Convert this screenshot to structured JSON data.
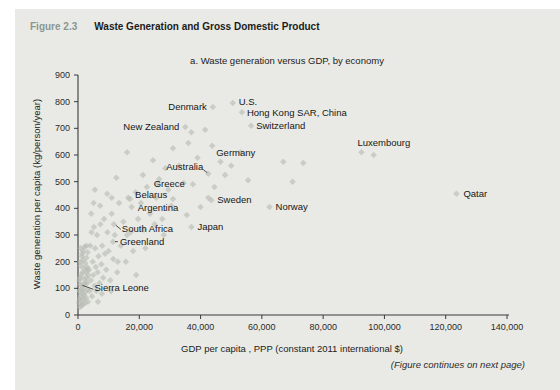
{
  "figure": {
    "label": "Figure 2.3",
    "title": "Waste Generation and Gross Domestic Product",
    "subtitle": "a. Waste generation versus GDP, by economy",
    "footer_note": "(Figure continues on next page)"
  },
  "colors": {
    "paper": "#e9eae5",
    "marker": "#b7bcb3",
    "axis": "#3a3a3a",
    "figure_label_text": "#8a9693",
    "body_text": "#1b1b1b"
  },
  "chart_data": {
    "type": "scatter",
    "title": "a. Waste generation versus GDP, by economy",
    "xlabel": "GDP per capita , PPP (constant 2011 international $)",
    "ylabel": "Waste generation per capita (kg/person/year)",
    "xlim": [
      0,
      140000
    ],
    "ylim": [
      0,
      900
    ],
    "grid": false,
    "x_ticks": [
      0,
      20000,
      40000,
      60000,
      80000,
      100000,
      120000,
      140000
    ],
    "x_tick_labels": [
      "0",
      "20,000",
      "40,000",
      "60,000",
      "80,000",
      "100,000",
      "120,000",
      "140,000"
    ],
    "y_ticks": [
      0,
      100,
      200,
      300,
      400,
      500,
      600,
      700,
      800,
      900
    ],
    "y_tick_labels": [
      "0",
      "100",
      "200",
      "300",
      "400",
      "500",
      "600",
      "700",
      "800",
      "900"
    ],
    "labeled_points": [
      {
        "name": "Denmark",
        "gdp": 44000,
        "waste": 780,
        "anchor": "end",
        "dx": -6,
        "dy": 3
      },
      {
        "name": "U.S.",
        "gdp": 50500,
        "waste": 795,
        "anchor": "start",
        "dx": 6,
        "dy": 2
      },
      {
        "name": "Hong Kong SAR, China",
        "gdp": 53500,
        "waste": 760,
        "anchor": "start",
        "dx": 5,
        "dy": 4
      },
      {
        "name": "Switzerland",
        "gdp": 56500,
        "waste": 710,
        "anchor": "start",
        "dx": 5,
        "dy": 3
      },
      {
        "name": "New Zealand",
        "gdp": 35000,
        "waste": 705,
        "anchor": "end",
        "dx": -6,
        "dy": 3
      },
      {
        "name": "Germany",
        "gdp": 43800,
        "waste": 635,
        "anchor": "start",
        "dx": 4,
        "dy": 10
      },
      {
        "name": "Australia",
        "gdp": 42500,
        "waste": 530,
        "anchor": "end",
        "dx": -5,
        "dy": -4,
        "leader": [
          -5,
          -4,
          -1,
          -1
        ]
      },
      {
        "name": "Greece",
        "gdp": 26000,
        "waste": 490,
        "anchor": "start",
        "dx": -4,
        "dy": 3
      },
      {
        "name": "Belarus",
        "gdp": 17000,
        "waste": 435,
        "anchor": "start",
        "dx": 5,
        "dy": -1
      },
      {
        "name": "Argentina",
        "gdp": 17500,
        "waste": 405,
        "anchor": "start",
        "dx": 6,
        "dy": 4
      },
      {
        "name": "Sweden",
        "gdp": 43500,
        "waste": 430,
        "anchor": "start",
        "dx": 6,
        "dy": 3
      },
      {
        "name": "Norway",
        "gdp": 62500,
        "waste": 405,
        "anchor": "start",
        "dx": 6,
        "dy": 3
      },
      {
        "name": "Japan",
        "gdp": 37000,
        "waste": 330,
        "anchor": "start",
        "dx": 6,
        "dy": 3
      },
      {
        "name": "South Africa",
        "gdp": 11700,
        "waste": 340,
        "anchor": "start",
        "dx": 8,
        "dy": 8,
        "leader": [
          7,
          5,
          2,
          1
        ]
      },
      {
        "name": "Greenland",
        "gdp": 11400,
        "waste": 275,
        "anchor": "start",
        "dx": 7,
        "dy": 3,
        "leader": [
          5,
          0,
          2,
          0
        ]
      },
      {
        "name": "Sierra Leone",
        "gdp": 800,
        "waste": 115,
        "anchor": "start",
        "dx": 14,
        "dy": 7,
        "leader": [
          13,
          5,
          2,
          1
        ]
      },
      {
        "name": "Luxembourg",
        "gdp": 92500,
        "waste": 610,
        "anchor": "start",
        "dx": -4,
        "dy": -6
      },
      {
        "name": "Qatar",
        "gdp": 123500,
        "waste": 455,
        "anchor": "start",
        "dx": 7,
        "dy": 3
      }
    ],
    "points": [
      [
        350,
        45
      ],
      [
        500,
        90
      ],
      [
        650,
        30
      ],
      [
        700,
        140
      ],
      [
        850,
        70
      ],
      [
        950,
        185
      ],
      [
        1050,
        55
      ],
      [
        1150,
        110
      ],
      [
        1250,
        220
      ],
      [
        1350,
        80
      ],
      [
        1450,
        160
      ],
      [
        1550,
        40
      ],
      [
        1650,
        240
      ],
      [
        1750,
        100
      ],
      [
        1850,
        175
      ],
      [
        1950,
        60
      ],
      [
        2050,
        135
      ],
      [
        2150,
        255
      ],
      [
        2250,
        85
      ],
      [
        2350,
        195
      ],
      [
        2450,
        120
      ],
      [
        2550,
        160
      ],
      [
        2650,
        65
      ],
      [
        2750,
        215
      ],
      [
        2850,
        140
      ],
      [
        2950,
        180
      ],
      [
        3050,
        95
      ],
      [
        3150,
        235
      ],
      [
        3250,
        50
      ],
      [
        3350,
        150
      ],
      [
        900,
        250
      ],
      [
        1200,
        35
      ],
      [
        1600,
        205
      ],
      [
        2000,
        75
      ],
      [
        3000,
        120
      ],
      [
        450,
        130
      ],
      [
        750,
        200
      ],
      [
        1100,
        150
      ],
      [
        1400,
        230
      ],
      [
        1900,
        115
      ],
      [
        2300,
        45
      ],
      [
        2700,
        260
      ],
      [
        3100,
        170
      ],
      [
        600,
        60
      ],
      [
        1000,
        95
      ],
      [
        3600,
        170
      ],
      [
        3800,
        90
      ],
      [
        4000,
        260
      ],
      [
        4200,
        130
      ],
      [
        4400,
        310
      ],
      [
        4600,
        70
      ],
      [
        4800,
        200
      ],
      [
        5000,
        150
      ],
      [
        5200,
        330
      ],
      [
        5400,
        110
      ],
      [
        5600,
        250
      ],
      [
        5800,
        180
      ],
      [
        6000,
        90
      ],
      [
        6200,
        300
      ],
      [
        6400,
        160
      ],
      [
        6700,
        220
      ],
      [
        7000,
        120
      ],
      [
        7300,
        340
      ],
      [
        7600,
        190
      ],
      [
        7900,
        260
      ],
      [
        8200,
        140
      ],
      [
        8500,
        360
      ],
      [
        8800,
        230
      ],
      [
        6500,
        50
      ],
      [
        7800,
        80
      ],
      [
        5500,
        470
      ],
      [
        7200,
        410
      ],
      [
        4300,
        380
      ],
      [
        5100,
        420
      ],
      [
        9200,
        170
      ],
      [
        9600,
        310
      ],
      [
        10000,
        240
      ],
      [
        10500,
        130
      ],
      [
        11000,
        380
      ],
      [
        11500,
        210
      ],
      [
        12000,
        300
      ],
      [
        12800,
        160
      ],
      [
        13400,
        420
      ],
      [
        14000,
        260
      ],
      [
        14800,
        350
      ],
      [
        15600,
        200
      ],
      [
        16400,
        440
      ],
      [
        17200,
        310
      ],
      [
        18000,
        240
      ],
      [
        18800,
        460
      ],
      [
        19600,
        360
      ],
      [
        10800,
        90
      ],
      [
        13000,
        200
      ],
      [
        16000,
        300
      ],
      [
        9500,
        455
      ],
      [
        11000,
        440
      ],
      [
        12500,
        515
      ],
      [
        20500,
        420
      ],
      [
        21500,
        320
      ],
      [
        22500,
        480
      ],
      [
        23500,
        380
      ],
      [
        24500,
        580
      ],
      [
        25500,
        440
      ],
      [
        26500,
        510
      ],
      [
        27500,
        360
      ],
      [
        28500,
        550
      ],
      [
        29500,
        470
      ],
      [
        21200,
        525
      ],
      [
        22000,
        250
      ],
      [
        25000,
        340
      ],
      [
        28000,
        300
      ],
      [
        19000,
        150
      ],
      [
        31000,
        625
      ],
      [
        31000,
        435
      ],
      [
        33000,
        560
      ],
      [
        34500,
        495
      ],
      [
        35500,
        375
      ],
      [
        36000,
        645
      ],
      [
        37000,
        685
      ],
      [
        37500,
        490
      ],
      [
        39000,
        590
      ],
      [
        40000,
        405
      ],
      [
        41500,
        695
      ],
      [
        42500,
        440
      ],
      [
        44500,
        480
      ],
      [
        46500,
        575
      ],
      [
        48000,
        525
      ],
      [
        50000,
        560
      ],
      [
        53000,
        610
      ],
      [
        55500,
        505
      ],
      [
        30500,
        410
      ],
      [
        96500,
        600
      ],
      [
        67000,
        575
      ],
      [
        73500,
        570
      ],
      [
        70000,
        500
      ],
      [
        16000,
        610
      ]
    ]
  }
}
